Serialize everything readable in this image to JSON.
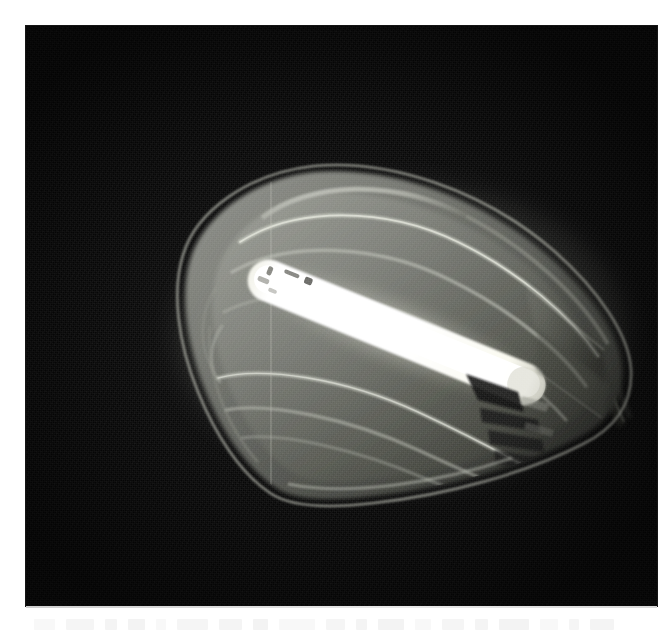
{
  "page": {
    "background_color": "#ffffff",
    "width": 668,
    "height": 644
  },
  "photograph": {
    "subject": "street-lamp-luminaire",
    "caption_visible": false,
    "background_color": "#070707",
    "frame": {
      "x": 26,
      "y": 26,
      "width": 631,
      "height": 580
    },
    "scene_description": "Illuminated street lamp head photographed at night against a black background",
    "colors": {
      "background": "#070707",
      "lamp_body_dark": "#2e2e2c",
      "lamp_body_mid": "#5d5f59",
      "lamp_body_light": "#8f918a",
      "rib_highlight": "#c9cbc2",
      "tube_glow": "#fdfdf6",
      "tube_core": "#ffffff",
      "socket_dark": "#121212",
      "mount_arm": "#3a3a38"
    }
  },
  "lamp": {
    "parts": [
      {
        "name": "outer-rim",
        "label": "Outer rim of prismatic refractor bowl"
      },
      {
        "name": "refractor-bowl",
        "label": "Translucent faceted refractor bowl"
      },
      {
        "name": "rib-1",
        "label": "Prismatic rib 1 (upper)"
      },
      {
        "name": "rib-2",
        "label": "Prismatic rib 2"
      },
      {
        "name": "rib-3",
        "label": "Prismatic rib 3"
      },
      {
        "name": "rib-4",
        "label": "Prismatic rib 4 (lower)"
      },
      {
        "name": "rib-5",
        "label": "Prismatic rib 5 (lower edge)"
      },
      {
        "name": "lamp-tube",
        "label": "Glowing tubular lamp (fluorescent / sodium)"
      },
      {
        "name": "lamp-socket",
        "label": "Lamp holder / socket"
      },
      {
        "name": "housing-end-cap",
        "label": "Housing end cap"
      },
      {
        "name": "mount-arm",
        "label": "Mounting arm / bracket pole"
      },
      {
        "name": "seam-line",
        "label": "Vertical mould seam on refractor"
      }
    ],
    "orientation": "tilted, long axis running upper-left to lower-right",
    "tube_angle_degrees": 22
  },
  "scan_artifacts": {
    "bleed_text_present": true,
    "bleed_text_legible": false,
    "bleed_block_widths": [
      34,
      46,
      20,
      28,
      16,
      52,
      38,
      24,
      60,
      30,
      18,
      44,
      26,
      36,
      22,
      48,
      30,
      16,
      40
    ]
  }
}
